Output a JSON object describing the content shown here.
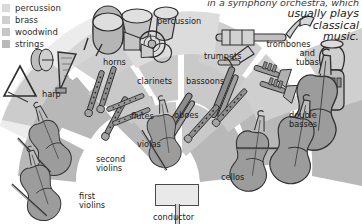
{
  "diagram": {
    "caption": {
      "top_clipped": "in a symphony orchestra, which",
      "lines": [
        "usually plays",
        "classical",
        "music."
      ]
    },
    "legend": {
      "items": [
        {
          "label": "percussion",
          "color": "#d9d9d9",
          "swatch_name": "legend-swatch-percussion"
        },
        {
          "label": "brass",
          "color": "#cfcfcf",
          "swatch_name": "legend-swatch-brass"
        },
        {
          "label": "woodwind",
          "color": "#c6c6c6",
          "swatch_name": "legend-swatch-woodwind"
        },
        {
          "label": "strings",
          "color": "#b9b9b9",
          "swatch_name": "legend-swatch-strings"
        }
      ]
    },
    "sections": [
      {
        "id": "percussion",
        "label": "percussion",
        "lines": [
          "percussion"
        ],
        "family": "percussion"
      },
      {
        "id": "trombones",
        "label": "trombones and tubas",
        "lines": [
          "trombones",
          "and",
          "tubas"
        ],
        "family": "brass"
      },
      {
        "id": "trumpets",
        "label": "trumpets",
        "lines": [
          "trumpets"
        ],
        "family": "brass"
      },
      {
        "id": "horns",
        "label": "horns",
        "lines": [
          "horns"
        ],
        "family": "brass"
      },
      {
        "id": "harp",
        "label": "harp",
        "lines": [
          "harp"
        ],
        "family": "strings"
      },
      {
        "id": "clarinets",
        "label": "clarinets",
        "lines": [
          "clarinets"
        ],
        "family": "woodwind"
      },
      {
        "id": "bassoons",
        "label": "bassoons",
        "lines": [
          "bassoons"
        ],
        "family": "woodwind"
      },
      {
        "id": "flutes",
        "label": "flutes",
        "lines": [
          "flutes"
        ],
        "family": "woodwind"
      },
      {
        "id": "oboes",
        "label": "oboes",
        "lines": [
          "oboes"
        ],
        "family": "woodwind"
      },
      {
        "id": "double-basses",
        "label": "double basses",
        "lines": [
          "double",
          "basses"
        ],
        "family": "strings"
      },
      {
        "id": "violas",
        "label": "violas",
        "lines": [
          "violas"
        ],
        "family": "strings"
      },
      {
        "id": "cellos",
        "label": "cellos",
        "lines": [
          "cellos"
        ],
        "family": "strings"
      },
      {
        "id": "second-violins",
        "label": "second violins",
        "lines": [
          "second",
          "violins"
        ],
        "family": "strings"
      },
      {
        "id": "first-violins",
        "label": "first violins",
        "lines": [
          "first",
          "violins"
        ],
        "family": "strings"
      },
      {
        "id": "conductor",
        "label": "conductor",
        "lines": [
          "conductor"
        ],
        "family": "conductor"
      }
    ],
    "colors": {
      "band_light": "#dcdcdc",
      "band_mid": "#c9c9c9",
      "band_dark": "#b8b8b8",
      "background": "#ffffff",
      "ink": "#3a3a3a",
      "text": "#1b1b1b"
    }
  }
}
